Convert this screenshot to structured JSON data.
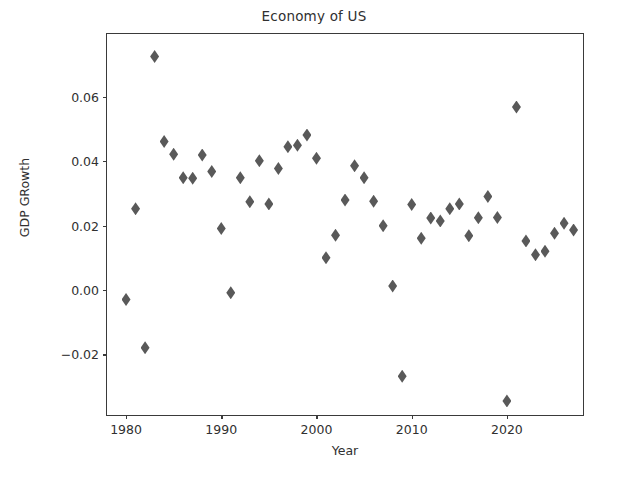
{
  "chart_data": {
    "type": "scatter",
    "title": "Economy of US",
    "xlabel": "Year",
    "ylabel": "GDP GRowth",
    "grid": false,
    "legend": false,
    "marker": "diamond",
    "marker_color": "#595959",
    "xlim": [
      1978.0,
      1828.0
    ],
    "xlim_actual": [
      1978.0,
      2028.2
    ],
    "ylim": [
      -0.0395,
      0.0795
    ],
    "xticks": [
      1980,
      1990,
      2000,
      2010,
      2020
    ],
    "xticklabels": [
      "1980",
      "1990",
      "2000",
      "2010",
      "2020"
    ],
    "yticks": [
      -0.02,
      0.0,
      0.02,
      0.04,
      0.06
    ],
    "yticklabels": [
      "−0.02",
      "0.00",
      "0.02",
      "0.04",
      "0.06"
    ],
    "x": [
      1980,
      1981,
      1982,
      1983,
      1984,
      1985,
      1986,
      1987,
      1988,
      1989,
      1990,
      1991,
      1992,
      1993,
      1994,
      1995,
      1996,
      1997,
      1998,
      1999,
      2000,
      2001,
      2002,
      2003,
      2004,
      2005,
      2006,
      2007,
      2008,
      2009,
      2010,
      2011,
      2012,
      2013,
      2014,
      2015,
      2016,
      2017,
      2018,
      2019,
      2020,
      2021,
      2022,
      2023,
      2024,
      2025,
      2026,
      2027
    ],
    "y": [
      -0.003,
      0.0252,
      -0.018,
      0.0725,
      0.0461,
      0.0421,
      0.0348,
      0.0347,
      0.0419,
      0.0368,
      0.0191,
      -0.0009,
      0.0348,
      0.0274,
      0.0401,
      0.0267,
      0.0377,
      0.0445,
      0.0449,
      0.0481,
      0.0409,
      0.01,
      0.017,
      0.0279,
      0.0386,
      0.0348,
      0.0275,
      0.0199,
      0.0012,
      -0.0268,
      0.0265,
      0.016,
      0.0223,
      0.0214,
      0.0252,
      0.0267,
      0.0168,
      0.0224,
      0.029,
      0.0225,
      -0.0345,
      0.0568,
      0.0152,
      0.0109,
      0.012,
      0.0176,
      0.0207,
      0.0186
    ],
    "points": [
      {
        "year": 1980,
        "value": -0.003
      },
      {
        "year": 1981,
        "value": 0.0252
      },
      {
        "year": 1982,
        "value": -0.018
      },
      {
        "year": 1983,
        "value": 0.0725
      },
      {
        "year": 1984,
        "value": 0.0461
      },
      {
        "year": 1985,
        "value": 0.0421
      },
      {
        "year": 1986,
        "value": 0.0348
      },
      {
        "year": 1987,
        "value": 0.0347
      },
      {
        "year": 1988,
        "value": 0.0419
      },
      {
        "year": 1989,
        "value": 0.0368
      },
      {
        "year": 1990,
        "value": 0.0191
      },
      {
        "year": 1991,
        "value": -0.0009
      },
      {
        "year": 1992,
        "value": 0.0348
      },
      {
        "year": 1993,
        "value": 0.0274
      },
      {
        "year": 1994,
        "value": 0.0401
      },
      {
        "year": 1995,
        "value": 0.0267
      },
      {
        "year": 1996,
        "value": 0.0377
      },
      {
        "year": 1997,
        "value": 0.0445
      },
      {
        "year": 1998,
        "value": 0.0449
      },
      {
        "year": 1999,
        "value": 0.0481
      },
      {
        "year": 2000,
        "value": 0.0409
      },
      {
        "year": 2001,
        "value": 0.01
      },
      {
        "year": 2002,
        "value": 0.017
      },
      {
        "year": 2003,
        "value": 0.0279
      },
      {
        "year": 2004,
        "value": 0.0386
      },
      {
        "year": 2005,
        "value": 0.0348
      },
      {
        "year": 2006,
        "value": 0.0275
      },
      {
        "year": 2007,
        "value": 0.0199
      },
      {
        "year": 2008,
        "value": 0.0012
      },
      {
        "year": 2009,
        "value": -0.0268
      },
      {
        "year": 2010,
        "value": 0.0265
      },
      {
        "year": 2011,
        "value": 0.016
      },
      {
        "year": 2012,
        "value": 0.0223
      },
      {
        "year": 2013,
        "value": 0.0214
      },
      {
        "year": 2014,
        "value": 0.0252
      },
      {
        "year": 2015,
        "value": 0.0267
      },
      {
        "year": 2016,
        "value": 0.0168
      },
      {
        "year": 2017,
        "value": 0.0224
      },
      {
        "year": 2018,
        "value": 0.029
      },
      {
        "year": 2019,
        "value": 0.0225
      },
      {
        "year": 2020,
        "value": -0.0345
      },
      {
        "year": 2021,
        "value": 0.0568
      },
      {
        "year": 2022,
        "value": 0.0152
      },
      {
        "year": 2023,
        "value": 0.0109
      },
      {
        "year": 2024,
        "value": 0.012
      },
      {
        "year": 2025,
        "value": 0.0176
      },
      {
        "year": 2026,
        "value": 0.0207
      },
      {
        "year": 2027,
        "value": 0.0186
      }
    ]
  }
}
